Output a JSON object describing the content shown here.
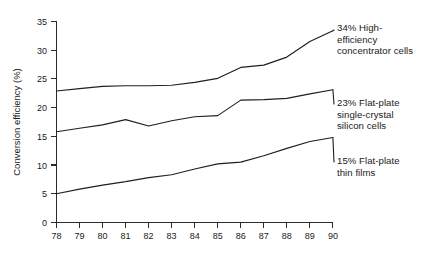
{
  "chart_data": {
    "type": "line",
    "title": "",
    "xlabel": "",
    "ylabel": "Conversion efficiency (%)",
    "xlim": [
      78,
      90
    ],
    "ylim": [
      0,
      35
    ],
    "grid": false,
    "legend_position": "right-inline-annotations",
    "x": [
      78,
      79,
      80,
      81,
      82,
      83,
      84,
      85,
      86,
      87,
      88,
      89,
      90
    ],
    "xtick_labels": [
      "78",
      "79",
      "80",
      "81",
      "82",
      "83",
      "84",
      "85",
      "86",
      "87",
      "88",
      "89",
      "90"
    ],
    "ytick_labels": [
      "0",
      "5",
      "10",
      "15",
      "20",
      "25",
      "30",
      "35"
    ],
    "yticks": [
      0,
      5,
      10,
      15,
      20,
      25,
      30,
      35
    ],
    "series": [
      {
        "name": "High-efficiency concentrator cells",
        "label": "34% High-\nefficiency\nconcentrator cells",
        "end_value_label": "34%",
        "values": [
          22.9,
          23.3,
          23.7,
          23.8,
          23.8,
          23.9,
          24.4,
          25.1,
          27.0,
          27.4,
          28.8,
          31.5,
          33.4
        ]
      },
      {
        "name": "Flat-plate single-crystal silicon cells",
        "label": "23% Flat-plate\nsingle-crystal\nsilicon cells",
        "end_value_label": "23%",
        "values": [
          15.8,
          16.4,
          17.0,
          17.9,
          16.8,
          17.7,
          18.4,
          18.6,
          21.3,
          21.4,
          21.6,
          22.4,
          23.1
        ]
      },
      {
        "name": "Flat-plate thin films",
        "label": "15% Flat-plate\nthin films",
        "end_value_label": "15%",
        "values": [
          5.0,
          5.8,
          6.5,
          7.1,
          7.8,
          8.3,
          9.3,
          10.2,
          10.5,
          11.6,
          12.9,
          14.1,
          14.8
        ]
      }
    ]
  }
}
